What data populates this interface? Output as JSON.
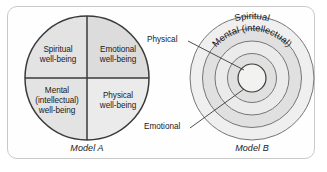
{
  "figure": {
    "models": [
      {
        "id": "model-a",
        "caption": "Model A",
        "type": "quadrant-circle",
        "quadrants": [
          {
            "position": "top-left",
            "label": "Spiritual\nwell-being",
            "fill": "#e3e3e3"
          },
          {
            "position": "top-right",
            "label": "Emotional\nwell-being",
            "fill": "#dcdcdc"
          },
          {
            "position": "bottom-left",
            "label": "Mental\n(intellectual)\nwell-being",
            "fill": "#e3e3e3"
          },
          {
            "position": "bottom-right",
            "label": "Physical\nwell-being",
            "fill": "#ebebeb"
          }
        ]
      },
      {
        "id": "model-b",
        "caption": "Model B",
        "type": "concentric-circle",
        "rings": [
          {
            "index": 1,
            "name": "Spiritual",
            "curved_label": "Spiritual",
            "fill": "#e0e0e0"
          },
          {
            "index": 2,
            "name": "Mental (intellectual)",
            "curved_label": "Mental (intellectual)",
            "fill": "#ebebeb"
          },
          {
            "index": 3,
            "name": "Emotional",
            "curved_label": "",
            "fill": "#e0e0e0"
          },
          {
            "index": 4,
            "name": "Physical",
            "curved_label": "",
            "fill": "#efefef"
          }
        ],
        "leader_labels": [
          {
            "name": "Physical",
            "text": "Physical"
          },
          {
            "name": "Emotional",
            "text": "Emotional"
          }
        ]
      }
    ],
    "colors": {
      "frame_border": "#c9c9c9",
      "stroke": "#3a3a3a",
      "ring_stroke": "#767676",
      "text": "#1a1a1a",
      "background": "#ffffff"
    }
  }
}
